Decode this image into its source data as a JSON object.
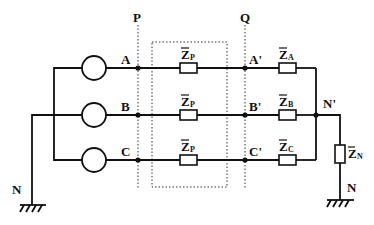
{
  "diagram": {
    "type": "three-phase circuit",
    "planes": [
      {
        "label": "P"
      },
      {
        "label": "Q"
      }
    ],
    "sources": [
      {
        "phase": "A",
        "node": "A"
      },
      {
        "phase": "B",
        "node": "B"
      },
      {
        "phase": "C",
        "node": "C"
      }
    ],
    "nodes": {
      "A": "A",
      "B": "B",
      "C": "C",
      "A_prime": "A'",
      "B_prime": "B'",
      "C_prime": "C'",
      "N_prime": "N'",
      "N_left": "N",
      "N_right": "N"
    },
    "line_impedances": [
      {
        "symbol": "Z",
        "sub": "P"
      },
      {
        "symbol": "Z",
        "sub": "P"
      },
      {
        "symbol": "Z",
        "sub": "P"
      }
    ],
    "load_impedances": [
      {
        "symbol": "Z",
        "sub": "A"
      },
      {
        "symbol": "Z",
        "sub": "B"
      },
      {
        "symbol": "Z",
        "sub": "C"
      }
    ],
    "neutral_impedance": {
      "symbol": "Z",
      "sub": "N"
    }
  }
}
